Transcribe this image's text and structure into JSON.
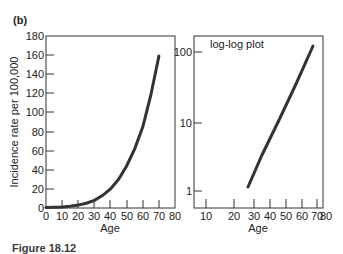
{
  "figure": {
    "panel_label": "(b)",
    "caption_partial": "Figure 18.12"
  },
  "chart_data": [
    {
      "type": "line",
      "title": "",
      "xlabel": "Age",
      "ylabel": "Incidence rate per 100,000",
      "xlim": [
        0,
        80
      ],
      "ylim": [
        0,
        180
      ],
      "x_ticks": [
        0,
        10,
        20,
        30,
        40,
        50,
        60,
        70,
        80
      ],
      "y_ticks": [
        0,
        20,
        40,
        60,
        80,
        100,
        120,
        140,
        160,
        180
      ],
      "grid": false,
      "legend": null,
      "series": [
        {
          "name": "Incidence rate",
          "x": [
            0,
            5,
            10,
            15,
            20,
            25,
            30,
            35,
            40,
            45,
            50,
            55,
            60,
            65,
            70
          ],
          "y": [
            0.5,
            0.7,
            1,
            1.8,
            3,
            5,
            8,
            13,
            20,
            30,
            44,
            62,
            85,
            118,
            159
          ]
        }
      ]
    },
    {
      "type": "line",
      "title": "log-log plot",
      "xlabel": "Age",
      "ylabel": "",
      "x_scale": "log",
      "y_scale": "log",
      "xlim": [
        8,
        80
      ],
      "ylim": [
        0.8,
        150
      ],
      "x_ticks": [
        10,
        20,
        30,
        40,
        50,
        60,
        70,
        80
      ],
      "y_ticks": [
        1,
        10,
        100
      ],
      "grid": false,
      "legend": null,
      "series": [
        {
          "name": "Incidence rate (log-log)",
          "x": [
            27,
            35,
            45,
            55,
            69
          ],
          "y": [
            1.1,
            3.5,
            12,
            35,
            125
          ]
        }
      ]
    }
  ],
  "layout": {
    "left": {
      "box": {
        "x0": 46,
        "y0": 36,
        "x1": 175,
        "y1": 208
      },
      "x_tick_px": [
        46,
        62,
        78,
        94,
        110,
        127,
        143,
        159,
        175
      ],
      "y_tick_px": [
        208,
        189,
        170,
        151,
        132,
        112,
        93,
        74,
        55,
        36
      ]
    },
    "right": {
      "box": {
        "x0": 194,
        "y0": 36,
        "x1": 323,
        "y1": 208
      },
      "x_tick_px": [
        206,
        234,
        254,
        270,
        286,
        302,
        317,
        323
      ],
      "y_tick_px": [
        191,
        123,
        52
      ],
      "line_px": [
        [
          248,
          187
        ],
        [
          262,
          155
        ],
        [
          280,
          118
        ],
        [
          296,
          84
        ],
        [
          313,
          46
        ]
      ],
      "title_px": [
        210,
        48
      ]
    },
    "colors": {
      "curve": "#333333",
      "axis": "#333333",
      "text": "#222222"
    }
  }
}
